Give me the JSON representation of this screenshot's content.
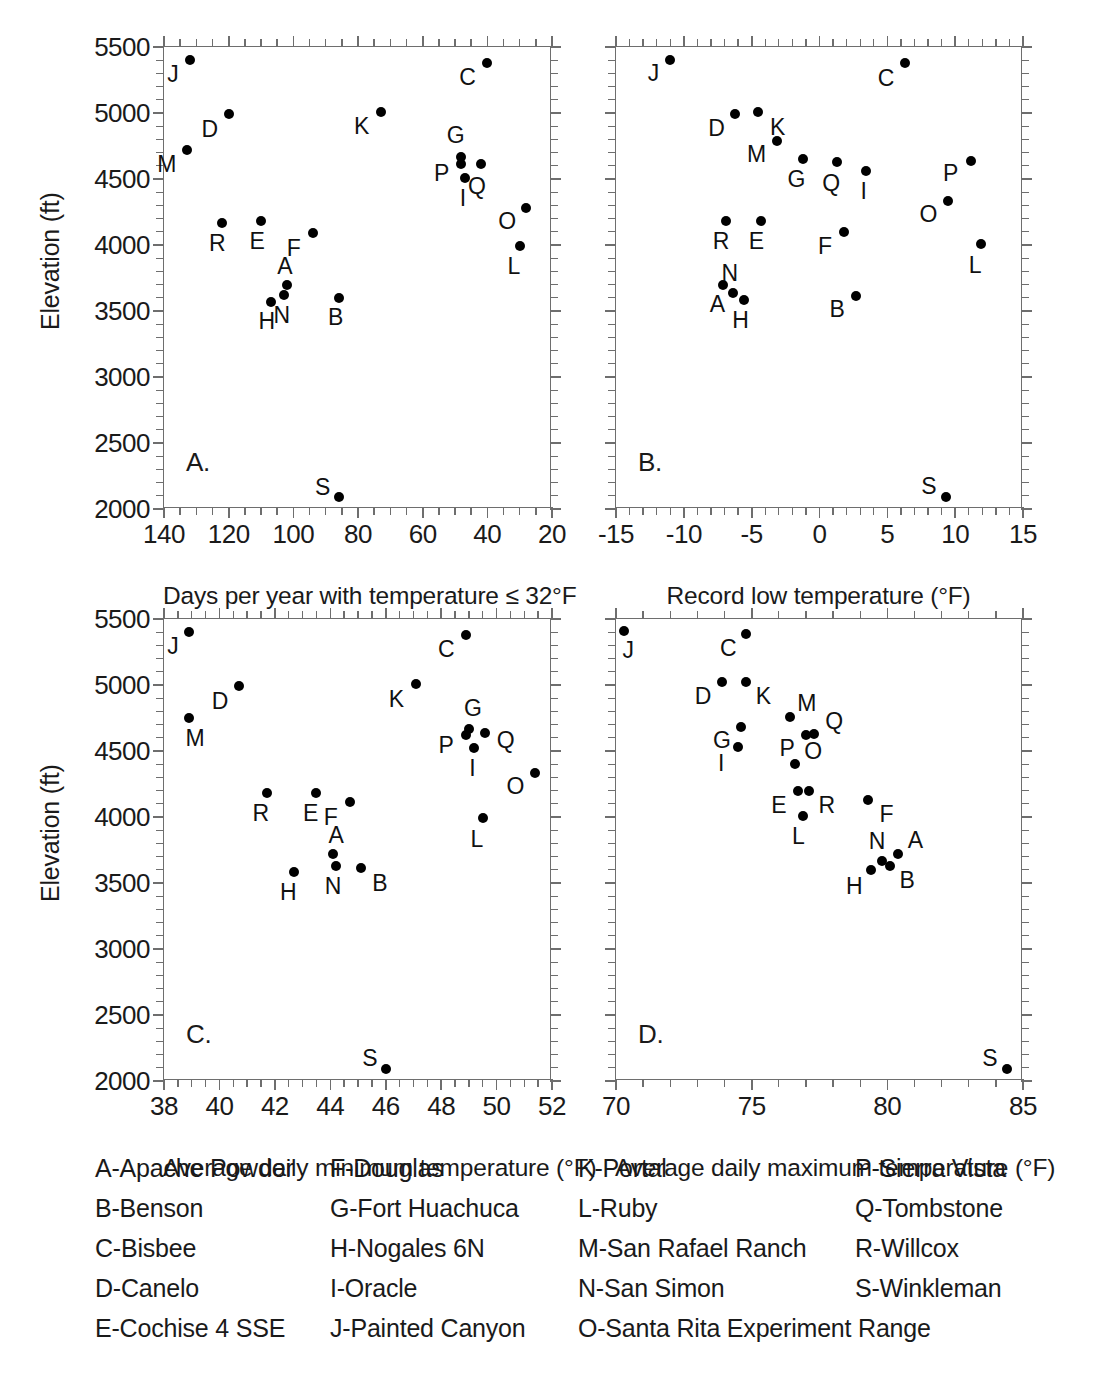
{
  "figure": {
    "y_axis_title": "Elevation (ft)",
    "y_ticks": [
      2000,
      2500,
      3000,
      3500,
      4000,
      4500,
      5000,
      5500
    ],
    "y_range": [
      2000,
      5500
    ],
    "y_minor_step": 100
  },
  "chart_data": [
    {
      "type": "scatter",
      "panel": "A.",
      "title": "",
      "xlabel": "Days per year with temperature ≤ 32°F",
      "ylabel": "Elevation (ft)",
      "xlim": [
        140,
        20
      ],
      "ylim": [
        2000,
        5500
      ],
      "x_ticks": [
        140,
        120,
        100,
        80,
        60,
        40,
        20
      ],
      "y_ticks": [
        2000,
        2500,
        3000,
        3500,
        4000,
        4500,
        5000,
        5500
      ],
      "x_reversed": true,
      "grid": false,
      "legend": "none",
      "points": [
        {
          "label": "A",
          "x": 102,
          "y": 3700,
          "lab_dx": -2,
          "lab_dy": -19
        },
        {
          "label": "B",
          "x": 86,
          "y": 3600,
          "lab_dx": -3,
          "lab_dy": 19
        },
        {
          "label": "C",
          "x": 40,
          "y": 5380,
          "lab_dx": -20,
          "lab_dy": 14
        },
        {
          "label": "D",
          "x": 120,
          "y": 4990,
          "lab_dx": -19,
          "lab_dy": 15
        },
        {
          "label": "E",
          "x": 110,
          "y": 4180,
          "lab_dx": -4,
          "lab_dy": 20
        },
        {
          "label": "F",
          "x": 94,
          "y": 4090,
          "lab_dx": -19,
          "lab_dy": 15
        },
        {
          "label": "G",
          "x": 48,
          "y": 4670,
          "lab_dx": -6,
          "lab_dy": -22
        },
        {
          "label": "H",
          "x": 107,
          "y": 3570,
          "lab_dx": -4,
          "lab_dy": 19
        },
        {
          "label": "I",
          "x": 47,
          "y": 4510,
          "lab_dx": -2,
          "lab_dy": 20
        },
        {
          "label": "J",
          "x": 132,
          "y": 5400,
          "lab_dx": -17,
          "lab_dy": 14
        },
        {
          "label": "K",
          "x": 73,
          "y": 5010,
          "lab_dx": -19,
          "lab_dy": 14
        },
        {
          "label": "L",
          "x": 30,
          "y": 3990,
          "lab_dx": -6,
          "lab_dy": 20
        },
        {
          "label": "M",
          "x": 133,
          "y": 4720,
          "lab_dx": -20,
          "lab_dy": 14
        },
        {
          "label": "N",
          "x": 103,
          "y": 3620,
          "lab_dx": -2,
          "lab_dy": 20
        },
        {
          "label": "O",
          "x": 28,
          "y": 4280,
          "lab_dx": -19,
          "lab_dy": 13
        },
        {
          "label": "P",
          "x": 48,
          "y": 4610,
          "lab_dx": -20,
          "lab_dy": 9
        },
        {
          "label": "Q",
          "x": 42,
          "y": 4610,
          "lab_dx": -4,
          "lab_dy": 22
        },
        {
          "label": "R",
          "x": 122,
          "y": 4165,
          "lab_dx": -5,
          "lab_dy": 20
        },
        {
          "label": "S",
          "x": 86,
          "y": 2090,
          "lab_dx": -16,
          "lab_dy": -10
        }
      ]
    },
    {
      "type": "scatter",
      "panel": "B.",
      "title": "",
      "xlabel": "Record low temperature (°F)",
      "ylabel": "Elevation (ft)",
      "xlim": [
        -15,
        15
      ],
      "ylim": [
        2000,
        5500
      ],
      "x_ticks": [
        -15,
        -10,
        -5,
        0,
        5,
        10,
        15
      ],
      "y_ticks": [
        2000,
        2500,
        3000,
        3500,
        4000,
        4500,
        5000,
        5500
      ],
      "x_reversed": false,
      "grid": false,
      "legend": "none",
      "points": [
        {
          "label": "A",
          "x": -7.1,
          "y": 3700,
          "lab_dx": -6,
          "lab_dy": 19
        },
        {
          "label": "B",
          "x": 2.7,
          "y": 3610,
          "lab_dx": -19,
          "lab_dy": 13
        },
        {
          "label": "C",
          "x": 6.3,
          "y": 5380,
          "lab_dx": -19,
          "lab_dy": 15
        },
        {
          "label": "D",
          "x": -6.2,
          "y": 4990,
          "lab_dx": -19,
          "lab_dy": 14
        },
        {
          "label": "E",
          "x": -4.3,
          "y": 4185,
          "lab_dx": -5,
          "lab_dy": 20
        },
        {
          "label": "F",
          "x": 1.8,
          "y": 4100,
          "lab_dx": -19,
          "lab_dy": 14
        },
        {
          "label": "G",
          "x": -1.2,
          "y": 4650,
          "lab_dx": -7,
          "lab_dy": 20
        },
        {
          "label": "H",
          "x": -5.6,
          "y": 3580,
          "lab_dx": -3,
          "lab_dy": 20
        },
        {
          "label": "I",
          "x": 3.4,
          "y": 4560,
          "lab_dx": -2,
          "lab_dy": 20
        },
        {
          "label": "J",
          "x": -11.0,
          "y": 5400,
          "lab_dx": -17,
          "lab_dy": 13
        },
        {
          "label": "K",
          "x": -4.5,
          "y": 5010,
          "lab_dx": 19,
          "lab_dy": 15
        },
        {
          "label": "L",
          "x": 11.9,
          "y": 4010,
          "lab_dx": -6,
          "lab_dy": 21
        },
        {
          "label": "M",
          "x": -3.1,
          "y": 4790,
          "lab_dx": -21,
          "lab_dy": 13
        },
        {
          "label": "N",
          "x": -6.4,
          "y": 3640,
          "lab_dx": -3,
          "lab_dy": -20
        },
        {
          "label": "O",
          "x": 9.5,
          "y": 4330,
          "lab_dx": -20,
          "lab_dy": 13
        },
        {
          "label": "P",
          "x": 11.2,
          "y": 4640,
          "lab_dx": -21,
          "lab_dy": 12
        },
        {
          "label": "Q",
          "x": 1.3,
          "y": 4630,
          "lab_dx": -6,
          "lab_dy": 21
        },
        {
          "label": "R",
          "x": -6.9,
          "y": 4180,
          "lab_dx": -5,
          "lab_dy": 20
        },
        {
          "label": "S",
          "x": 9.3,
          "y": 2090,
          "lab_dx": -17,
          "lab_dy": -11
        }
      ]
    },
    {
      "type": "scatter",
      "panel": "C.",
      "title": "",
      "xlabel": "Average daily minimum temperature (°F)",
      "ylabel": "Elevation (ft)",
      "xlim": [
        38,
        52
      ],
      "ylim": [
        2000,
        5500
      ],
      "x_ticks": [
        38,
        40,
        42,
        44,
        46,
        48,
        50,
        52
      ],
      "y_ticks": [
        2000,
        2500,
        3000,
        3500,
        4000,
        4500,
        5000,
        5500
      ],
      "x_reversed": false,
      "grid": false,
      "legend": "none",
      "points": [
        {
          "label": "A",
          "x": 44.1,
          "y": 3720,
          "lab_dx": 3,
          "lab_dy": -19
        },
        {
          "label": "B",
          "x": 45.1,
          "y": 3610,
          "lab_dx": 19,
          "lab_dy": 15
        },
        {
          "label": "C",
          "x": 48.9,
          "y": 5380,
          "lab_dx": -20,
          "lab_dy": 14
        },
        {
          "label": "D",
          "x": 40.7,
          "y": 4990,
          "lab_dx": -19,
          "lab_dy": 15
        },
        {
          "label": "E",
          "x": 43.5,
          "y": 4180,
          "lab_dx": -6,
          "lab_dy": 20
        },
        {
          "label": "F",
          "x": 44.7,
          "y": 4110,
          "lab_dx": -19,
          "lab_dy": 15
        },
        {
          "label": "G",
          "x": 49.0,
          "y": 4670,
          "lab_dx": 4,
          "lab_dy": -21
        },
        {
          "label": "H",
          "x": 42.7,
          "y": 3580,
          "lab_dx": -6,
          "lab_dy": 20
        },
        {
          "label": "I",
          "x": 49.2,
          "y": 4520,
          "lab_dx": -2,
          "lab_dy": 20
        },
        {
          "label": "J",
          "x": 38.9,
          "y": 5400,
          "lab_dx": -16,
          "lab_dy": 14
        },
        {
          "label": "K",
          "x": 47.1,
          "y": 5010,
          "lab_dx": -20,
          "lab_dy": 15
        },
        {
          "label": "L",
          "x": 49.5,
          "y": 3990,
          "lab_dx": -6,
          "lab_dy": 21
        },
        {
          "label": "M",
          "x": 38.9,
          "y": 4750,
          "lab_dx": 6,
          "lab_dy": 20
        },
        {
          "label": "N",
          "x": 44.2,
          "y": 3630,
          "lab_dx": -3,
          "lab_dy": 20
        },
        {
          "label": "O",
          "x": 51.4,
          "y": 4330,
          "lab_dx": -20,
          "lab_dy": 13
        },
        {
          "label": "P",
          "x": 48.9,
          "y": 4620,
          "lab_dx": -20,
          "lab_dy": 10
        },
        {
          "label": "Q",
          "x": 49.6,
          "y": 4640,
          "lab_dx": 20,
          "lab_dy": 7
        },
        {
          "label": "R",
          "x": 41.7,
          "y": 4180,
          "lab_dx": -6,
          "lab_dy": 20
        },
        {
          "label": "S",
          "x": 46.0,
          "y": 2090,
          "lab_dx": -16,
          "lab_dy": -11
        }
      ]
    },
    {
      "type": "scatter",
      "panel": "D.",
      "title": "",
      "xlabel": "Average daily maximum temperature (°F)",
      "ylabel": "Elevation (ft)",
      "xlim": [
        70,
        85
      ],
      "ylim": [
        2000,
        5500
      ],
      "x_ticks": [
        70,
        75,
        80,
        85
      ],
      "y_ticks": [
        2000,
        2500,
        3000,
        3500,
        4000,
        4500,
        5000,
        5500
      ],
      "x_reversed": false,
      "grid": false,
      "legend": "none",
      "points": [
        {
          "label": "A",
          "x": 80.4,
          "y": 3720,
          "lab_dx": 17,
          "lab_dy": -14
        },
        {
          "label": "B",
          "x": 80.1,
          "y": 3630,
          "lab_dx": 17,
          "lab_dy": 14
        },
        {
          "label": "C",
          "x": 74.8,
          "y": 5390,
          "lab_dx": -18,
          "lab_dy": 14
        },
        {
          "label": "D",
          "x": 73.9,
          "y": 5020,
          "lab_dx": -19,
          "lab_dy": 14
        },
        {
          "label": "E",
          "x": 76.7,
          "y": 4200,
          "lab_dx": -19,
          "lab_dy": 14
        },
        {
          "label": "F",
          "x": 79.3,
          "y": 4130,
          "lab_dx": 18,
          "lab_dy": 14
        },
        {
          "label": "G",
          "x": 74.6,
          "y": 4680,
          "lab_dx": -19,
          "lab_dy": 13
        },
        {
          "label": "H",
          "x": 79.4,
          "y": 3600,
          "lab_dx": -17,
          "lab_dy": 16
        },
        {
          "label": "I",
          "x": 74.5,
          "y": 4530,
          "lab_dx": -17,
          "lab_dy": 16
        },
        {
          "label": "J",
          "x": 70.3,
          "y": 5410,
          "lab_dx": 4,
          "lab_dy": 19
        },
        {
          "label": "K",
          "x": 74.8,
          "y": 5020,
          "lab_dx": 17,
          "lab_dy": 14
        },
        {
          "label": "L",
          "x": 76.9,
          "y": 4010,
          "lab_dx": -5,
          "lab_dy": 20
        },
        {
          "label": "M",
          "x": 76.4,
          "y": 4760,
          "lab_dx": 17,
          "lab_dy": -14
        },
        {
          "label": "N",
          "x": 79.8,
          "y": 3670,
          "lab_dx": -5,
          "lab_dy": -20
        },
        {
          "label": "O",
          "x": 76.6,
          "y": 4400,
          "lab_dx": 18,
          "lab_dy": -13
        },
        {
          "label": "P",
          "x": 77.0,
          "y": 4620,
          "lab_dx": -19,
          "lab_dy": 13
        },
        {
          "label": "Q",
          "x": 77.3,
          "y": 4630,
          "lab_dx": 20,
          "lab_dy": -13
        },
        {
          "label": "R",
          "x": 77.1,
          "y": 4200,
          "lab_dx": 18,
          "lab_dy": 14
        },
        {
          "label": "S",
          "x": 84.4,
          "y": 2090,
          "lab_dx": -17,
          "lab_dy": -11
        }
      ]
    }
  ],
  "legend": {
    "columns": [
      {
        "items": [
          "A-Apache Powder",
          "B-Benson",
          "C-Bisbee",
          "D-Canelo",
          "E-Cochise 4 SSE"
        ]
      },
      {
        "items": [
          "F-Douglas",
          "G-Fort Huachuca",
          "H-Nogales 6N",
          "I-Oracle",
          "J-Painted Canyon"
        ]
      },
      {
        "items": [
          "K-Portal",
          "L-Ruby",
          "M-San Rafael Ranch",
          "N-San Simon",
          "O-Santa Rita Experiment Range"
        ]
      },
      {
        "items": [
          "P-Sierra Vista",
          "Q-Tombstone",
          "R-Willcox",
          "S-Winkleman"
        ]
      }
    ]
  }
}
